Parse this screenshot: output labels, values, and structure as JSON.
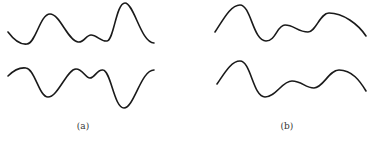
{
  "panels": [
    {
      "label": "(a)",
      "label_x": 83,
      "curves": [
        {
          "name": "a-top",
          "d": "M8,32 C14,40 20,45 27,44 C36,43 40,14 50,14 C60,14 68,41 78,42 C84,43 86,35 91,35 C97,35 101,42 107,41 C114,40 116,3 125,3 C134,3 141,43 154,43"
        },
        {
          "name": "a-bottom",
          "d": "M8,76 C13,71 19,67 26,68 C35,69 39,97 48,97 C58,97 67,69 76,69 C83,69 85,78 90,78 C95,78 97,69 103,70 C111,71 114,108 124,108 C134,108 141,70 154,70"
        }
      ]
    },
    {
      "label": "(b)",
      "label_x": 287,
      "curves": [
        {
          "name": "b-top",
          "d": "M215,32 C222,22 230,5 240,5 C251,5 253,41 266,41 C276,41 277,25 285,25 C294,25 298,32 308,32 C316,32 320,13 329,13 C343,13 358,24 366,36"
        },
        {
          "name": "b-bottom",
          "d": "M217,84 C224,74 231,61 240,61 C251,61 253,97 265,97 C276,97 282,81 292,81 C302,81 305,88 314,88 C323,88 329,70 339,70 C352,70 360,81 366,91"
        }
      ]
    }
  ]
}
